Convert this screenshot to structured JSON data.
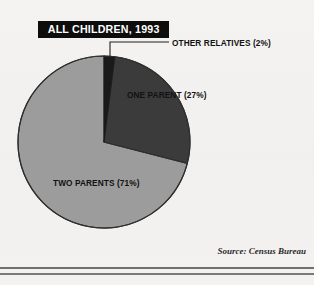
{
  "figure": {
    "title": "ALL CHILDREN, 1993",
    "source": "Source: Census Bureau"
  },
  "labels": {
    "other_relatives": "OTHER RELATIVES (2%)",
    "one_parent": "ONE PARENT (27%)",
    "two_parents": "TWO PARENTS (71%)"
  },
  "colors": {
    "background": "#f3f2f0",
    "banner_fill": "#0d0d0d",
    "banner_text": "#ffffff",
    "slice_other_relatives": "#1a1a1a",
    "slice_one_parent": "#3b3b3b",
    "slice_two_parents": "#9c9c9c",
    "outline": "#2e2e2e",
    "leader_line": "#1f1f1f",
    "rule": "#6f6f6f"
  },
  "chart_data": {
    "type": "pie",
    "title": "ALL CHILDREN, 1993",
    "subtitle": "",
    "xlabel": "",
    "ylabel": "",
    "legend_position": "none",
    "grid": false,
    "units": "percent",
    "start_angle_deg": 0,
    "direction": "clockwise",
    "categories": [
      "OTHER RELATIVES",
      "ONE PARENT",
      "TWO PARENTS"
    ],
    "values": [
      2,
      27,
      71
    ],
    "slices": [
      {
        "label": "OTHER RELATIVES",
        "value": 2,
        "display": "OTHER RELATIVES (2%)",
        "color": "#1a1a1a",
        "label_placement": "outside-leader"
      },
      {
        "label": "ONE PARENT",
        "value": 27,
        "display": "ONE PARENT (27%)",
        "color": "#3b3b3b",
        "label_placement": "inside"
      },
      {
        "label": "TWO PARENTS",
        "value": 71,
        "display": "TWO PARENTS (71%)",
        "color": "#9c9c9c",
        "label_placement": "inside"
      }
    ],
    "total": 100,
    "annotations": [
      "Source: Census Bureau"
    ]
  }
}
